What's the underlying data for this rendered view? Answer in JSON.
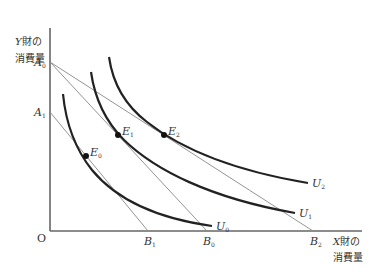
{
  "diagram": {
    "type": "indifference-curve-diagram",
    "y_axis_label": {
      "line1_var": "Y",
      "line1_rest": "財の",
      "line2": "消費量"
    },
    "x_axis_label": {
      "line1_var": "X",
      "line1_rest": "財の",
      "line2": "消費量"
    },
    "origin_label": "O",
    "y_intercepts": [
      {
        "name": "A",
        "sub": "0"
      },
      {
        "name": "A",
        "sub": "1"
      }
    ],
    "x_intercepts": [
      {
        "name": "B",
        "sub": "1"
      },
      {
        "name": "B",
        "sub": "0"
      },
      {
        "name": "B",
        "sub": "2"
      }
    ],
    "curves": [
      {
        "name": "U",
        "sub": "0"
      },
      {
        "name": "U",
        "sub": "1"
      },
      {
        "name": "U",
        "sub": "2"
      }
    ],
    "points": [
      {
        "name": "E",
        "sub": "0"
      },
      {
        "name": "E",
        "sub": "1"
      },
      {
        "name": "E",
        "sub": "2"
      }
    ],
    "budget_lines": [
      {
        "from": "A0",
        "to": "B0"
      },
      {
        "from": "A0",
        "to": "B2"
      },
      {
        "from": "A1",
        "to": "B1"
      }
    ],
    "colors": {
      "axis": "#666666",
      "curve": "#222222",
      "budget_line": "#888888",
      "text": "#333333"
    }
  }
}
